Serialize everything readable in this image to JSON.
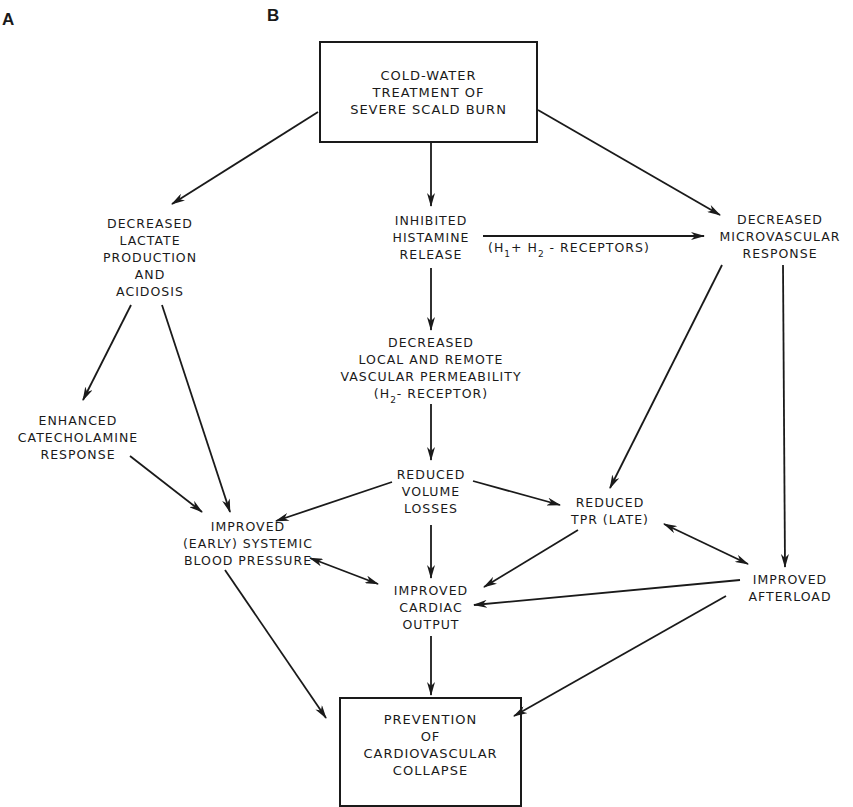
{
  "panel_labels": {
    "a": "A",
    "b": "B"
  },
  "nodes": {
    "start": {
      "lines": [
        "COLD-WATER",
        "TREATMENT OF",
        "SEVERE SCALD BURN"
      ]
    },
    "lactate": {
      "lines": [
        "DECREASED",
        "LACTATE",
        "PRODUCTION",
        "AND",
        "ACIDOSIS"
      ]
    },
    "histamine": {
      "lines": [
        "INHIBITED",
        "HISTAMINE",
        "RELEASE"
      ]
    },
    "microvascular": {
      "lines": [
        "DECREASED",
        "MICROVASCULAR",
        "RESPONSE"
      ]
    },
    "permeability": {
      "lines": [
        "DECREASED",
        "LOCAL AND REMOTE",
        "VASCULAR PERMEABILITY"
      ],
      "receptor_prefix": "(H",
      "receptor_sub": "2",
      "receptor_suffix": "- RECEPTOR)"
    },
    "catecholamine": {
      "lines": [
        "ENHANCED",
        "CATECHOLAMINE",
        "RESPONSE"
      ]
    },
    "volume": {
      "lines": [
        "REDUCED",
        "VOLUME",
        "LOSSES"
      ]
    },
    "tpr": {
      "lines": [
        "REDUCED",
        "TPR (LATE)"
      ]
    },
    "bp": {
      "lines": [
        "IMPROVED",
        "(EARLY) SYSTEMIC",
        "BLOOD PRESSURE"
      ]
    },
    "cardiac": {
      "lines": [
        "IMPROVED",
        "CARDIAC",
        "OUTPUT"
      ]
    },
    "afterload": {
      "lines": [
        "IMPROVED",
        "AFTERLOAD"
      ]
    },
    "end": {
      "lines": [
        "PREVENTION",
        "OF",
        "CARDIOVASCULAR",
        "COLLAPSE"
      ]
    }
  },
  "edge_labels": {
    "histamine_to_microvascular": {
      "prefix": "(H",
      "sub1": "1",
      "plus": "+ H",
      "sub2": "2",
      "suffix": " - RECEPTORS)"
    }
  },
  "edges": [
    {
      "from": "start",
      "to": "lactate",
      "type": "directed"
    },
    {
      "from": "start",
      "to": "histamine",
      "type": "directed"
    },
    {
      "from": "start",
      "to": "microvascular",
      "type": "directed"
    },
    {
      "from": "histamine",
      "to": "microvascular",
      "type": "directed",
      "label": "(H1+ H2 - RECEPTORS)"
    },
    {
      "from": "histamine",
      "to": "permeability",
      "type": "directed"
    },
    {
      "from": "lactate",
      "to": "catecholamine",
      "type": "directed"
    },
    {
      "from": "lactate",
      "to": "bp",
      "type": "directed"
    },
    {
      "from": "catecholamine",
      "to": "bp",
      "type": "directed"
    },
    {
      "from": "permeability",
      "to": "volume",
      "type": "directed"
    },
    {
      "from": "volume",
      "to": "bp",
      "type": "directed"
    },
    {
      "from": "volume",
      "to": "tpr",
      "type": "directed"
    },
    {
      "from": "volume",
      "to": "cardiac",
      "type": "directed"
    },
    {
      "from": "microvascular",
      "to": "tpr",
      "type": "directed"
    },
    {
      "from": "microvascular",
      "to": "afterload",
      "type": "directed"
    },
    {
      "from": "tpr",
      "to": "afterload",
      "type": "bidirectional"
    },
    {
      "from": "tpr",
      "to": "cardiac",
      "type": "directed"
    },
    {
      "from": "bp",
      "to": "cardiac",
      "type": "bidirectional"
    },
    {
      "from": "afterload",
      "to": "cardiac",
      "type": "directed"
    },
    {
      "from": "bp",
      "to": "end",
      "type": "directed"
    },
    {
      "from": "cardiac",
      "to": "end",
      "type": "directed"
    },
    {
      "from": "afterload",
      "to": "end",
      "type": "directed"
    }
  ]
}
